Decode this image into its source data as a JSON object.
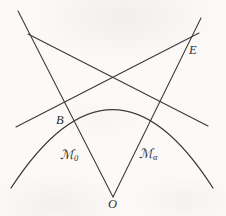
{
  "figure": {
    "caption_present": false,
    "background_color": "#fbfaf9",
    "ink_color": "#3a3734",
    "width": 226,
    "height": 216,
    "labels": {
      "vertex_o": "O",
      "point_b": "B",
      "point_e": "E",
      "region_m0_base": "ℳ",
      "region_m0_sub": "0",
      "region_malpha_base": "ℳ",
      "region_malpha_sub": "α"
    },
    "label_positions": {
      "vertex_o": {
        "x": 108,
        "y": 198
      },
      "point_b": {
        "x": 56,
        "y": 114
      },
      "point_e": {
        "x": 189,
        "y": 44
      },
      "region_m0": {
        "x": 60,
        "y": 148
      },
      "region_malpha": {
        "x": 139,
        "y": 147
      }
    },
    "geometry": {
      "arc": {
        "name": "circular-arc",
        "path": "M 11 188 Q 113 31 213 188",
        "description": "large circular arc opening downward"
      },
      "lines": [
        {
          "name": "ray-o-to-upper-left",
          "x1": 113,
          "y1": 197,
          "x2": 18,
          "y2": 11,
          "description": "ray from vertex O through point B to upper left corner"
        },
        {
          "name": "ray-o-to-upper-right",
          "x1": 113,
          "y1": 197,
          "x2": 201,
          "y2": 18,
          "description": "ray from vertex O through E to upper right corner"
        },
        {
          "name": "tangent-left-through-b-to-e",
          "x1": 16,
          "y1": 127,
          "x2": 199,
          "y2": 33,
          "description": "tangent line touching arc at B, rising to point E"
        },
        {
          "name": "tangent-right-to-upper-left",
          "x1": 208,
          "y1": 126,
          "x2": 28,
          "y2": 34,
          "description": "tangent line touching arc on the right, rising to upper left"
        }
      ],
      "intersections": [
        {
          "name": "point-o",
          "x": 113,
          "y": 197
        },
        {
          "name": "point-b",
          "x": 64,
          "y": 101
        },
        {
          "name": "point-e",
          "x": 188,
          "y": 43
        },
        {
          "name": "upper-left-crossing",
          "x": 35,
          "y": 40
        },
        {
          "name": "center-crossing",
          "x": 113,
          "y": 72
        },
        {
          "name": "right-crossing",
          "x": 157,
          "y": 103
        }
      ]
    }
  }
}
